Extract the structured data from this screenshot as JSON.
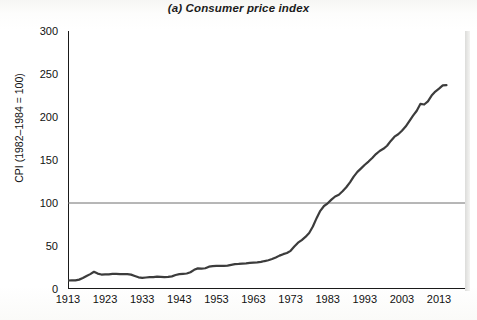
{
  "chart_data": {
    "type": "line",
    "title": "(a) Consumer price index",
    "xlabel": "",
    "ylabel": "CPI (1982–1984 = 100)",
    "xlim": [
      1913,
      2020
    ],
    "ylim": [
      0,
      300
    ],
    "yticks": [
      0,
      50,
      100,
      150,
      200,
      250,
      300
    ],
    "xticks": [
      1913,
      1923,
      1933,
      1943,
      1953,
      1963,
      1973,
      1983,
      1993,
      2003,
      2013
    ],
    "grid": false,
    "legend": null,
    "reference_lines": [
      {
        "axis": "y",
        "value": 100,
        "label": "",
        "color": "#6e6e6e"
      }
    ],
    "line_color": "#3c3c3c",
    "line_width": 2.2,
    "x": [
      1913,
      1914,
      1915,
      1916,
      1917,
      1918,
      1919,
      1920,
      1921,
      1922,
      1923,
      1924,
      1925,
      1926,
      1927,
      1928,
      1929,
      1930,
      1931,
      1932,
      1933,
      1934,
      1935,
      1936,
      1937,
      1938,
      1939,
      1940,
      1941,
      1942,
      1943,
      1944,
      1945,
      1946,
      1947,
      1948,
      1949,
      1950,
      1951,
      1952,
      1953,
      1954,
      1955,
      1956,
      1957,
      1958,
      1959,
      1960,
      1961,
      1962,
      1963,
      1964,
      1965,
      1966,
      1967,
      1968,
      1969,
      1970,
      1971,
      1972,
      1973,
      1974,
      1975,
      1976,
      1977,
      1978,
      1979,
      1980,
      1981,
      1982,
      1983,
      1984,
      1985,
      1986,
      1987,
      1988,
      1989,
      1990,
      1991,
      1992,
      1993,
      1994,
      1995,
      1996,
      1997,
      1998,
      1999,
      2000,
      2001,
      2002,
      2003,
      2004,
      2005,
      2006,
      2007,
      2008,
      2009,
      2010,
      2011,
      2012,
      2013,
      2014,
      2015
    ],
    "values": [
      9.9,
      10.0,
      10.1,
      10.9,
      12.8,
      15.1,
      17.3,
      20.0,
      17.9,
      16.8,
      17.1,
      17.1,
      17.5,
      17.7,
      17.4,
      17.2,
      17.2,
      16.7,
      15.2,
      13.6,
      12.9,
      13.4,
      13.7,
      13.9,
      14.4,
      14.1,
      13.9,
      14.0,
      14.7,
      16.3,
      17.3,
      17.6,
      18.0,
      19.5,
      22.3,
      24.0,
      23.8,
      24.1,
      26.0,
      26.6,
      26.8,
      26.9,
      26.8,
      27.2,
      28.1,
      28.9,
      29.2,
      29.6,
      29.9,
      30.3,
      30.6,
      31.0,
      31.5,
      32.5,
      33.4,
      34.8,
      36.7,
      38.8,
      40.5,
      41.8,
      44.4,
      49.3,
      53.8,
      56.9,
      60.6,
      65.2,
      72.6,
      82.4,
      90.9,
      96.5,
      99.6,
      103.9,
      107.6,
      109.6,
      113.6,
      118.3,
      124.0,
      130.7,
      136.2,
      140.3,
      144.5,
      148.2,
      152.4,
      156.9,
      160.5,
      163.0,
      166.6,
      172.2,
      177.1,
      179.9,
      184.0,
      188.9,
      195.3,
      201.6,
      207.3,
      215.3,
      214.5,
      218.1,
      224.9,
      229.6,
      233.0,
      236.7,
      237.0
    ]
  },
  "axes": {
    "y_tick_labels": [
      "300",
      "250",
      "200",
      "150",
      "100",
      "50",
      "0"
    ],
    "x_tick_labels": [
      "1913",
      "1923",
      "1933",
      "1943",
      "1953",
      "1963",
      "1973",
      "1983",
      "1993",
      "2003",
      "2013"
    ],
    "y_axis_title": "CPI (1982–1984 = 100)"
  }
}
